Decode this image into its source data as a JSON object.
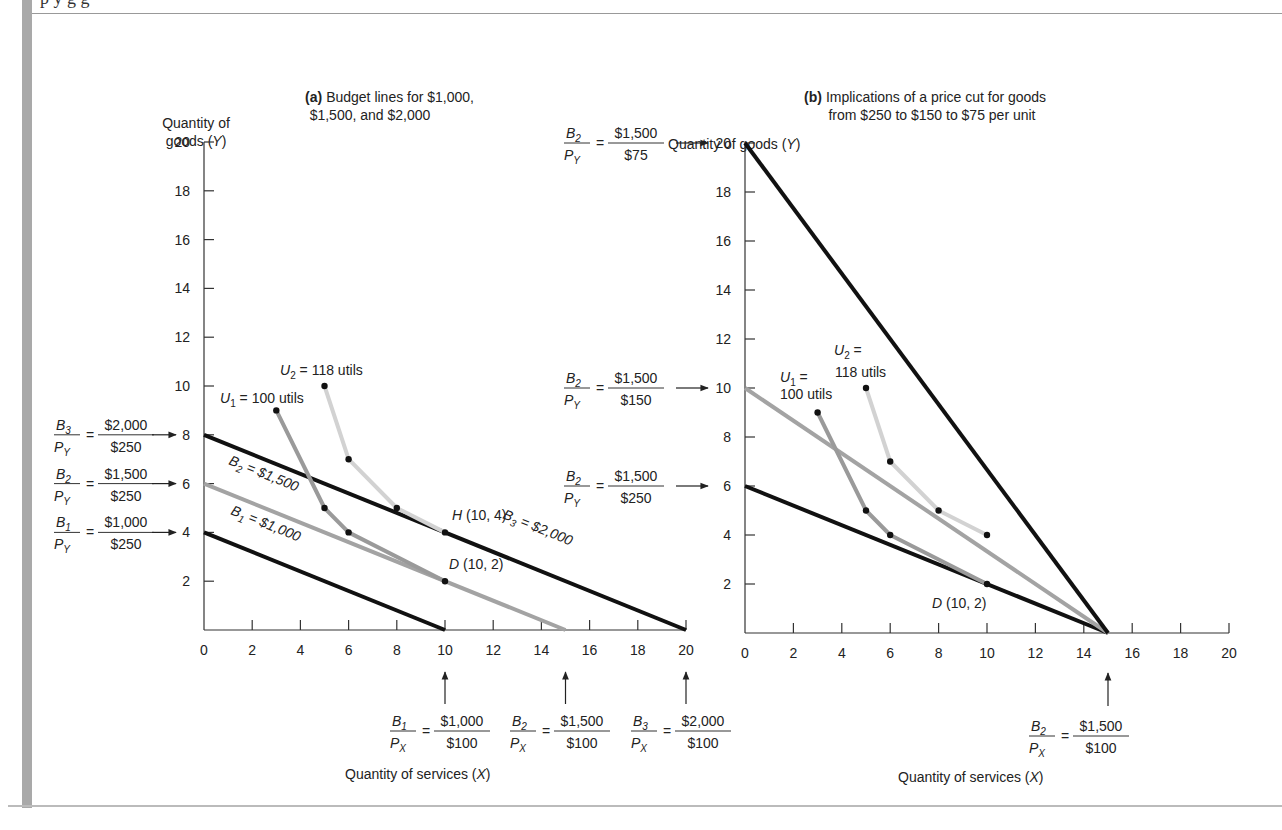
{
  "page": {
    "cut_off_caption": "p    y         g        g",
    "left_bar_color": "#a9a9a9"
  },
  "panel_a": {
    "title_bold": "(a)",
    "title_line1": "Budget lines for $1,000,",
    "title_line2": "$1,500, and $2,000",
    "y_label_line1": "Quantity of",
    "y_label_line2": "goods (Y)",
    "x_label": "Quantity of services (X)",
    "y_ticks": [
      "2",
      "4",
      "6",
      "8",
      "10",
      "12",
      "14",
      "16",
      "18",
      "20"
    ],
    "x_ticks": [
      "0",
      "2",
      "4",
      "6",
      "8",
      "10",
      "12",
      "14",
      "16",
      "18",
      "20"
    ],
    "line_labels": {
      "b1": "B1 = $1,000",
      "b2": "B2 = $1,500",
      "b3": "B3 = $2,000"
    },
    "curve_labels": {
      "u1": "U1 = 100 utils",
      "u2": "U2 = 118 utils"
    },
    "point_labels": {
      "h": "H (10, 4)",
      "d": "D (10, 2)"
    },
    "y_intercept_annotations": [
      {
        "num": "B3",
        "den": "PY",
        "value_num": "$2,000",
        "value_den": "$250",
        "points_to": "8"
      },
      {
        "num": "B2",
        "den": "PY",
        "value_num": "$1,500",
        "value_den": "$250",
        "points_to": "6"
      },
      {
        "num": "B1",
        "den": "PY",
        "value_num": "$1,000",
        "value_den": "$250",
        "points_to": "4"
      }
    ],
    "x_intercept_annotations": [
      {
        "num": "B1",
        "den": "PX",
        "value_num": "$1,000",
        "value_den": "$100",
        "points_to": "10"
      },
      {
        "num": "B2",
        "den": "PX",
        "value_num": "$1,500",
        "value_den": "$100",
        "points_to": "15"
      },
      {
        "num": "B3",
        "den": "PX",
        "value_num": "$2,000",
        "value_den": "$100",
        "points_to": "20"
      }
    ]
  },
  "panel_b": {
    "title_bold": "(b)",
    "title_line1": "Implications of a price cut for goods",
    "title_line2": "from $250 to $150 to $75 per unit",
    "y_label": "Quantity of goods (Y)",
    "x_label": "Quantity of services (X)",
    "y_ticks": [
      "2",
      "4",
      "6",
      "8",
      "10",
      "12",
      "14",
      "16",
      "18",
      "20"
    ],
    "x_ticks": [
      "0",
      "2",
      "4",
      "6",
      "8",
      "10",
      "12",
      "14",
      "16",
      "18",
      "20"
    ],
    "curve_labels": {
      "u1_line1": "U1 =",
      "u1_line2": "100 utils",
      "u2_line1": "U2 =",
      "u2_line2": "118 utils"
    },
    "point_labels": {
      "d": "D (10, 2)"
    },
    "y_intercept_annotations": [
      {
        "num": "B2",
        "den": "PY",
        "value_num": "$1,500",
        "value_den": "$75",
        "points_to": "20"
      },
      {
        "num": "B2",
        "den": "PY",
        "value_num": "$1,500",
        "value_den": "$150",
        "points_to": "10"
      },
      {
        "num": "B2",
        "den": "PY",
        "value_num": "$1,500",
        "value_den": "$250",
        "points_to": "6"
      }
    ],
    "x_intercept_annotations": [
      {
        "num": "B2",
        "den": "PX",
        "value_num": "$1,500",
        "value_den": "$100",
        "points_to": "15"
      }
    ]
  },
  "chart_data": [
    {
      "type": "line",
      "title": "(a) Budget lines for $1,000, $1,500, and $2,000",
      "xlabel": "Quantity of services (X)",
      "ylabel": "Quantity of goods (Y)",
      "xlim": [
        0,
        20
      ],
      "ylim": [
        0,
        20
      ],
      "grid": false,
      "series": [
        {
          "name": "B1 = $1,000",
          "x": [
            0,
            10
          ],
          "y": [
            4,
            0
          ],
          "color": "#111111"
        },
        {
          "name": "B2 = $1,500",
          "x": [
            0,
            15
          ],
          "y": [
            6,
            0
          ],
          "color": "#a0a0a0"
        },
        {
          "name": "B3 = $2,000",
          "x": [
            0,
            20
          ],
          "y": [
            8,
            0
          ],
          "color": "#111111"
        },
        {
          "name": "U1 = 100 utils",
          "x": [
            3,
            5,
            6,
            10
          ],
          "y": [
            9,
            5,
            4,
            2
          ],
          "color": "#9a9a9a"
        },
        {
          "name": "U2 = 118 utils",
          "x": [
            5,
            6,
            8,
            10
          ],
          "y": [
            10,
            7,
            5,
            4
          ],
          "color": "#d0d0d0"
        }
      ],
      "annotations": [
        "H (10, 4)",
        "D (10, 2)"
      ]
    },
    {
      "type": "line",
      "title": "(b) Implications of a price cut for goods from $250 to $150 to $75 per unit",
      "xlabel": "Quantity of services (X)",
      "ylabel": "Quantity of goods (Y)",
      "xlim": [
        0,
        20
      ],
      "ylim": [
        0,
        20
      ],
      "grid": false,
      "series": [
        {
          "name": "B2 at PY=$250",
          "x": [
            0,
            15
          ],
          "y": [
            6,
            0
          ],
          "color": "#111111"
        },
        {
          "name": "B2 at PY=$150",
          "x": [
            0,
            15
          ],
          "y": [
            10,
            0
          ],
          "color": "#a0a0a0"
        },
        {
          "name": "B2 at PY=$75",
          "x": [
            0,
            15
          ],
          "y": [
            20,
            0
          ],
          "color": "#111111"
        },
        {
          "name": "U1 = 100 utils",
          "x": [
            3,
            5,
            6,
            10
          ],
          "y": [
            9,
            5,
            4,
            2
          ],
          "color": "#9a9a9a"
        },
        {
          "name": "U2 = 118 utils",
          "x": [
            5,
            6,
            8,
            10
          ],
          "y": [
            10,
            7,
            5,
            4
          ],
          "color": "#d0d0d0"
        }
      ],
      "annotations": [
        "D (10, 2)"
      ]
    }
  ]
}
